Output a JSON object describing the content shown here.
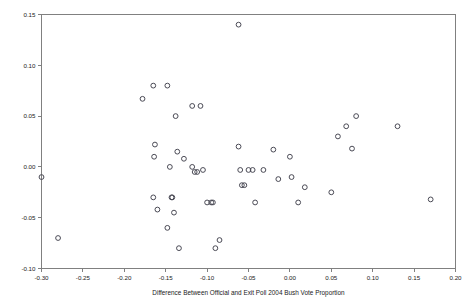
{
  "chart_data": {
    "type": "scatter",
    "title": "",
    "xlabel": "Difference Between Official and Exit Poll 2004 Bush Vote Proportion",
    "ylabel": "",
    "xlim": [
      -0.3,
      0.2
    ],
    "ylim": [
      -0.1,
      0.15
    ],
    "grid": false,
    "legend": null,
    "marker": "open-circle",
    "xticks": [
      "-0.30",
      "-0.25",
      "-0.20",
      "-0.15",
      "-0.10",
      "-0.05",
      "0.00",
      "0.05",
      "0.10",
      "0.15",
      "0.20"
    ],
    "xtick_values": [
      -0.3,
      -0.25,
      -0.2,
      -0.15,
      -0.1,
      -0.05,
      0.0,
      0.05,
      0.1,
      0.15,
      0.2
    ],
    "yticks": [
      "0.15",
      "0.10",
      "0.05",
      "0.00",
      "-0.05",
      "-0.10"
    ],
    "ytick_values": [
      0.15,
      0.1,
      0.05,
      0.0,
      -0.05,
      -0.1
    ],
    "series": [
      {
        "name": "states",
        "points": [
          [
            -0.3,
            -0.01
          ],
          [
            -0.28,
            -0.07
          ],
          [
            -0.178,
            0.067
          ],
          [
            -0.165,
            0.08
          ],
          [
            -0.163,
            0.022
          ],
          [
            -0.164,
            0.01
          ],
          [
            -0.165,
            -0.03
          ],
          [
            -0.16,
            -0.042
          ],
          [
            -0.148,
            0.08
          ],
          [
            -0.148,
            -0.06
          ],
          [
            -0.145,
            0.0
          ],
          [
            -0.143,
            -0.03
          ],
          [
            -0.142,
            -0.03
          ],
          [
            -0.14,
            -0.045
          ],
          [
            -0.138,
            0.05
          ],
          [
            -0.136,
            0.015
          ],
          [
            -0.134,
            -0.08
          ],
          [
            -0.128,
            0.008
          ],
          [
            -0.118,
            0.06
          ],
          [
            -0.118,
            0.0
          ],
          [
            -0.115,
            -0.005
          ],
          [
            -0.112,
            -0.005
          ],
          [
            -0.108,
            0.06
          ],
          [
            -0.105,
            -0.003
          ],
          [
            -0.1,
            -0.035
          ],
          [
            -0.095,
            -0.035
          ],
          [
            -0.093,
            -0.035
          ],
          [
            -0.09,
            -0.08
          ],
          [
            -0.085,
            -0.072
          ],
          [
            -0.062,
            0.14
          ],
          [
            -0.062,
            0.02
          ],
          [
            -0.06,
            -0.003
          ],
          [
            -0.058,
            -0.018
          ],
          [
            -0.055,
            -0.018
          ],
          [
            -0.05,
            -0.003
          ],
          [
            -0.045,
            -0.003
          ],
          [
            -0.042,
            -0.035
          ],
          [
            -0.032,
            -0.003
          ],
          [
            -0.02,
            0.017
          ],
          [
            -0.014,
            -0.012
          ],
          [
            0.0,
            0.01
          ],
          [
            0.002,
            -0.01
          ],
          [
            0.01,
            -0.035
          ],
          [
            0.018,
            -0.02
          ],
          [
            0.05,
            -0.025
          ],
          [
            0.058,
            0.03
          ],
          [
            0.068,
            0.04
          ],
          [
            0.075,
            0.018
          ],
          [
            0.08,
            0.05
          ],
          [
            0.13,
            0.04
          ],
          [
            0.17,
            -0.032
          ]
        ]
      }
    ]
  },
  "figure": {
    "background_color": "#ffffff",
    "axis_color": "#808080",
    "marker_color": "#4a4a55",
    "text_color": "#1a1a1a"
  }
}
